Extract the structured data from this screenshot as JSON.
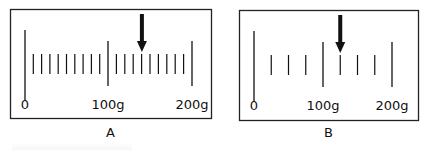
{
  "figure": {
    "panels": [
      {
        "id": "A",
        "caption": "A",
        "frame": {
          "x": 10,
          "y": 9,
          "w": 201,
          "h": 109
        },
        "scale": {
          "min": 0,
          "max": 200,
          "unit": "g",
          "major_labels": [
            "0",
            "100g",
            "200g"
          ],
          "major_x": [
            25,
            108,
            192
          ],
          "minor_step_g": 10,
          "minor_ticks_between_majors": 9,
          "pointer_value_g": 140
        }
      },
      {
        "id": "B",
        "caption": "B",
        "frame": {
          "x": 239,
          "y": 10,
          "w": 179,
          "h": 110
        },
        "scale": {
          "min": 0,
          "max": 200,
          "unit": "g",
          "major_labels": [
            "0",
            "100g",
            "200g"
          ],
          "major_x": [
            254,
            323,
            392
          ],
          "minor_step_g": 25,
          "minor_ticks_between_majors": 3,
          "pointer_value_g": 125
        }
      }
    ]
  },
  "chart_data": [
    {
      "type": "scale",
      "title": "A",
      "axis_range": [
        0,
        200
      ],
      "unit": "g",
      "tick_labels": [
        "0",
        "100g",
        "200g"
      ],
      "minor_division": 10,
      "pointer_reading": 140
    },
    {
      "type": "scale",
      "title": "B",
      "axis_range": [
        0,
        200
      ],
      "unit": "g",
      "tick_labels": [
        "0",
        "100g",
        "200g"
      ],
      "minor_division": 25,
      "pointer_reading": 125
    }
  ]
}
